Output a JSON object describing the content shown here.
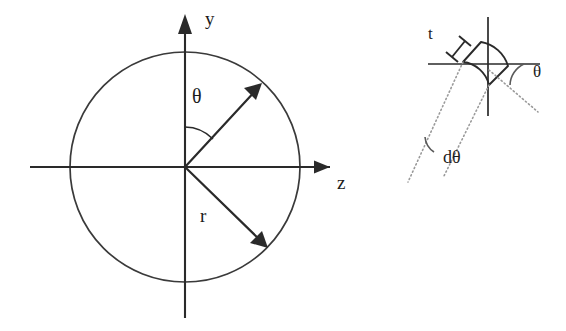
{
  "figure": {
    "background_color": "#ffffff",
    "line_color": "#2a2a2a",
    "dotted_color": "#9a9a9a"
  },
  "left_diagram": {
    "name": "polar-coordinate-circle",
    "axes": {
      "y_axis_label": "y",
      "z_axis_label": "z",
      "horizontal_axis_name": "z-axis",
      "vertical_axis_name": "y-axis"
    },
    "circle": {
      "center_x": 185,
      "center_y": 167,
      "radius": 115
    },
    "angle_label": "θ",
    "radius_label": "r",
    "vectors": [
      {
        "name": "theta-direction-vector",
        "angle_from_y_axis_deg": 45,
        "label": "θ"
      },
      {
        "name": "radius-vector",
        "angle_from_z_axis_deg": -45,
        "label": "r"
      }
    ]
  },
  "right_diagram": {
    "name": "differential-element-detail",
    "thickness_label": "t",
    "angle_label": "θ",
    "angle_increment_label": "dθ",
    "element_description": "curved wedge area element",
    "axes": {
      "horizontal_axis_name": "horizontal-reference-line",
      "vertical_axis_name": "vertical-reference-line"
    }
  }
}
